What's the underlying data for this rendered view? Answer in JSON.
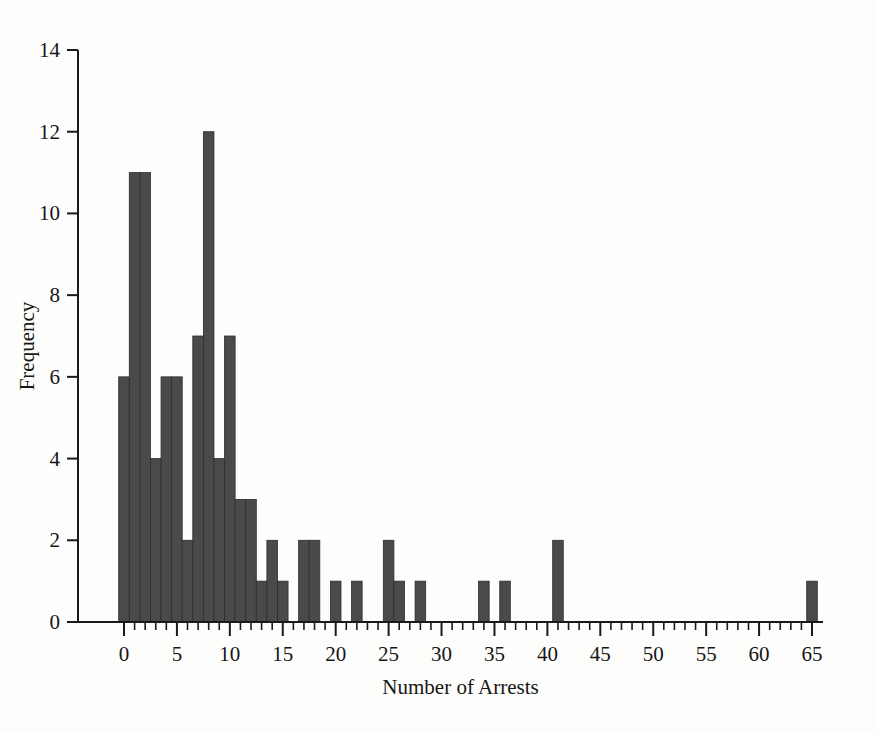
{
  "chart_data": {
    "type": "bar",
    "title": "",
    "subtitle": "",
    "xlabel": "Number of Arrests",
    "ylabel": "Frequency",
    "xlim": [
      -1,
      66
    ],
    "ylim": [
      0,
      14
    ],
    "grid": false,
    "legend": null,
    "bar_color": "#4a4a4a",
    "bar_edge_color": "#2c2c2c",
    "background_color": "#fdfdfb",
    "axis_color": "#1a1a1a",
    "bin_width": 1,
    "x_tick_labels": [
      "0",
      "5",
      "10",
      "15",
      "20",
      "25",
      "30",
      "35",
      "40",
      "45",
      "50",
      "55",
      "60",
      "65"
    ],
    "x_tick_values": [
      0,
      5,
      10,
      15,
      20,
      25,
      30,
      35,
      40,
      45,
      50,
      55,
      60,
      65
    ],
    "x_minor_tick_step": 1,
    "y_tick_labels": [
      "0",
      "2",
      "4",
      "6",
      "8",
      "10",
      "12",
      "14"
    ],
    "y_tick_values": [
      0,
      2,
      4,
      6,
      8,
      10,
      12,
      14
    ],
    "categories": [
      0,
      1,
      2,
      3,
      4,
      5,
      6,
      7,
      8,
      9,
      10,
      11,
      12,
      13,
      14,
      15,
      17,
      18,
      20,
      22,
      25,
      26,
      28,
      34,
      36,
      41,
      65
    ],
    "values": [
      6,
      11,
      11,
      4,
      6,
      6,
      2,
      7,
      12,
      4,
      7,
      3,
      3,
      1,
      2,
      1,
      2,
      2,
      1,
      1,
      2,
      1,
      1,
      1,
      1,
      2,
      1
    ],
    "bars": [
      {
        "x": 0,
        "height": 6
      },
      {
        "x": 1,
        "height": 11
      },
      {
        "x": 2,
        "height": 11
      },
      {
        "x": 3,
        "height": 4
      },
      {
        "x": 4,
        "height": 6
      },
      {
        "x": 5,
        "height": 6
      },
      {
        "x": 6,
        "height": 2
      },
      {
        "x": 7,
        "height": 7
      },
      {
        "x": 8,
        "height": 12
      },
      {
        "x": 9,
        "height": 4
      },
      {
        "x": 10,
        "height": 7
      },
      {
        "x": 11,
        "height": 3
      },
      {
        "x": 12,
        "height": 3
      },
      {
        "x": 13,
        "height": 1
      },
      {
        "x": 14,
        "height": 2
      },
      {
        "x": 15,
        "height": 1
      },
      {
        "x": 17,
        "height": 2
      },
      {
        "x": 18,
        "height": 2
      },
      {
        "x": 20,
        "height": 1
      },
      {
        "x": 22,
        "height": 1
      },
      {
        "x": 25,
        "height": 2
      },
      {
        "x": 26,
        "height": 1
      },
      {
        "x": 28,
        "height": 1
      },
      {
        "x": 34,
        "height": 1
      },
      {
        "x": 36,
        "height": 1
      },
      {
        "x": 41,
        "height": 2
      },
      {
        "x": 65,
        "height": 1
      }
    ]
  }
}
